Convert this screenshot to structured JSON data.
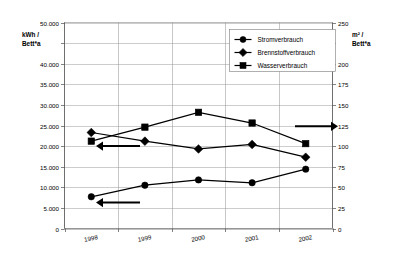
{
  "chart_data": {
    "type": "line",
    "title": "",
    "subtitle": "",
    "xlabel": "",
    "ylabel": "kWh / Bett*a",
    "y2label": "m² / Bett*a",
    "categories": [
      "1998",
      "1999",
      "2000",
      "2001",
      "2002"
    ],
    "grid": true,
    "legend_position": "top-right",
    "ylim": [
      0,
      50000
    ],
    "y2lim": [
      0,
      250
    ],
    "yticks": [
      "0",
      "5.000",
      "10.000",
      "15.000",
      "20.000",
      "25.000",
      "30.000",
      "35.000",
      "40.000",
      "",
      "50.000"
    ],
    "ytick_values": [
      0,
      5000,
      10000,
      15000,
      20000,
      25000,
      30000,
      35000,
      40000,
      45000,
      50000
    ],
    "y2ticks": [
      "0",
      "25",
      "50",
      "75",
      "100",
      "125",
      "150",
      "175",
      "200",
      "",
      "250"
    ],
    "y2tick_values": [
      0,
      25,
      50,
      75,
      100,
      125,
      150,
      175,
      200,
      225,
      250
    ],
    "series": [
      {
        "name": "Stromverbrauch",
        "marker": "circle",
        "axis": "left",
        "unit": "kWh / Bett*a",
        "values": [
          7700,
          10500,
          11800,
          11100,
          14400
        ]
      },
      {
        "name": "Brennstoffverbrauch",
        "marker": "diamond",
        "axis": "left",
        "unit": "kWh / Bett*a",
        "values": [
          23300,
          21200,
          19300,
          20400,
          17300
        ]
      },
      {
        "name": "Wasserverbrauch",
        "marker": "square",
        "axis": "right",
        "unit": "m² / Bett*a",
        "values": [
          106,
          123,
          141,
          128,
          103
        ]
      }
    ],
    "annotations": [
      {
        "name": "left-arrow-upper",
        "direction": "left",
        "near_value": 20000,
        "axis": "left"
      },
      {
        "name": "left-arrow-lower",
        "direction": "left",
        "near_value": 6300,
        "axis": "left"
      },
      {
        "name": "right-arrow",
        "direction": "right",
        "near_value": 124,
        "axis": "right"
      }
    ],
    "colors": {
      "series": "#000000",
      "grid": "#9a9a9a",
      "axis": "#4d4d4d",
      "background": "#ffffff"
    }
  },
  "legend": {
    "items": [
      {
        "label": "Stromverbrauch",
        "marker": "circle"
      },
      {
        "label": "Brennstoffverbrauch",
        "marker": "diamond"
      },
      {
        "label": "Wasserverbrauch",
        "marker": "square"
      }
    ]
  },
  "axes": {
    "left_title_line1": "kWh /",
    "left_title_line2": "Bett*a",
    "right_title_line1": "m² /",
    "right_title_line2": "Bett*a"
  }
}
